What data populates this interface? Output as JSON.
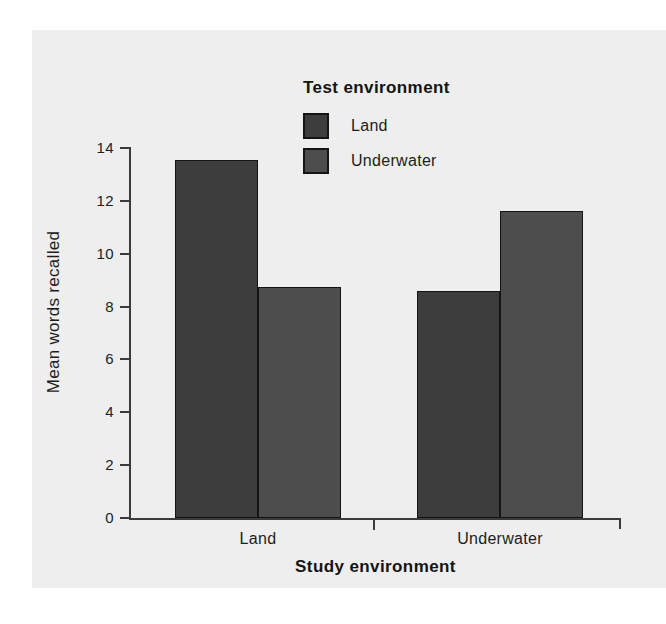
{
  "chart_data": {
    "type": "bar",
    "title": "",
    "xlabel": "Study environment",
    "ylabel": "Mean words recalled",
    "categories": [
      "Land",
      "Underwater"
    ],
    "series": [
      {
        "name": "Land",
        "values": [
          13.55,
          8.6
        ],
        "color": "#3d3d3d"
      },
      {
        "name": "Underwater",
        "values": [
          8.75,
          11.6
        ],
        "color": "#4d4d4d"
      }
    ],
    "ylim": [
      0,
      14
    ],
    "yticks": [
      0,
      2,
      4,
      6,
      8,
      10,
      12,
      14
    ],
    "ytick_labels": [
      "0",
      "2",
      "4",
      "6",
      "8",
      "10",
      "12",
      "14"
    ],
    "grid": false,
    "legend": {
      "title": "Test environment",
      "position": "top-center",
      "entries": [
        {
          "label": "Land",
          "color": "#3d3d3d"
        },
        {
          "label": "Underwater",
          "color": "#4d4d4d"
        }
      ]
    },
    "axis_color": "#3b3b3b",
    "background": "#eeeeee"
  }
}
